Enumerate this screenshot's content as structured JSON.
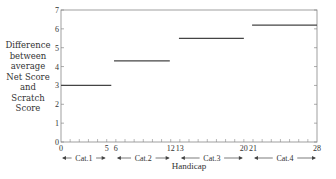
{
  "chart_data": {
    "type": "line",
    "title": "",
    "xlabel": "Handicap",
    "ylabel_lines": [
      "Difference",
      "between",
      "average",
      "Net Score",
      "and",
      "Scratch",
      "Score"
    ],
    "xlim": [
      0,
      28
    ],
    "ylim": [
      0,
      7
    ],
    "yticks": [
      0,
      1,
      2,
      3,
      4,
      5,
      6,
      7
    ],
    "xtick_labels": [
      {
        "value": 0,
        "label": "0"
      },
      {
        "value": 5,
        "label": "5"
      },
      {
        "value": 6,
        "label": "6"
      },
      {
        "value": 12,
        "label": "12"
      },
      {
        "value": 13,
        "label": "13"
      },
      {
        "value": 20,
        "label": "20"
      },
      {
        "value": 21,
        "label": "21"
      },
      {
        "value": 28,
        "label": "28"
      }
    ],
    "xminor_ticks": [
      1,
      2,
      3,
      4,
      5,
      6,
      7,
      8,
      9,
      10,
      11,
      12,
      13,
      14,
      15,
      16,
      17,
      18,
      19,
      20,
      21,
      22,
      23,
      24,
      25,
      26,
      27
    ],
    "grid": false,
    "series": [
      {
        "name": "Cat.1",
        "x_start": 0,
        "x_end": 5.5,
        "y": 3.0
      },
      {
        "name": "Cat.2",
        "x_start": 5.8,
        "x_end": 11.9,
        "y": 4.3
      },
      {
        "name": "Cat.3",
        "x_start": 12.9,
        "x_end": 20.0,
        "y": 5.5
      },
      {
        "name": "Cat.4",
        "x_start": 20.9,
        "x_end": 28,
        "y": 6.2
      }
    ],
    "categories": [
      {
        "label": "Cat.1",
        "from": 0,
        "to": 5
      },
      {
        "label": "Cat.2",
        "from": 6,
        "to": 12
      },
      {
        "label": "Cat.3",
        "from": 13,
        "to": 20
      },
      {
        "label": "Cat.4",
        "from": 21,
        "to": 28
      }
    ]
  }
}
